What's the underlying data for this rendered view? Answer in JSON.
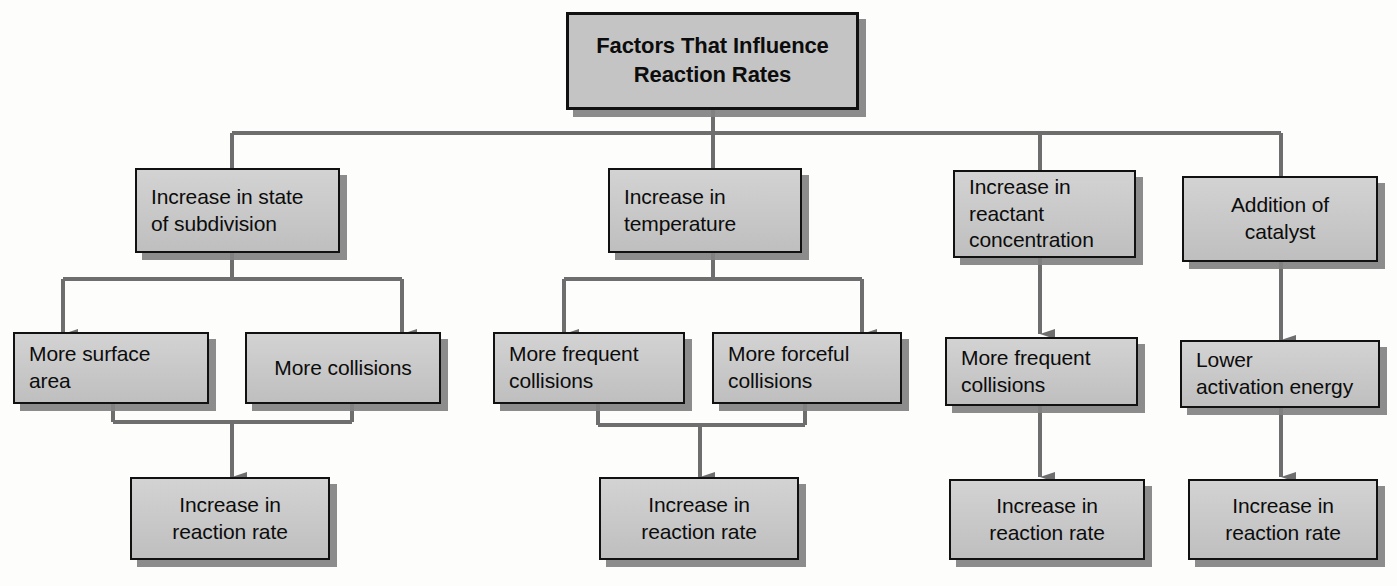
{
  "diagram": {
    "title_box": {
      "label": "Factors That Influence\nReaction Rates"
    },
    "factors": [
      {
        "id": "subdivision",
        "label": "Increase in state\nof subdivision"
      },
      {
        "id": "temperature",
        "label": "Increase in\ntemperature"
      },
      {
        "id": "concentration",
        "label": "Increase in\nreactant\nconcentration"
      },
      {
        "id": "catalyst",
        "label": "Addition of\ncatalyst"
      }
    ],
    "effects": [
      {
        "id": "more-surface-area",
        "label": "More surface\narea"
      },
      {
        "id": "more-collisions",
        "label": "More collisions"
      },
      {
        "id": "more-frequent-collisions-temp",
        "label": "More frequent\ncollisions"
      },
      {
        "id": "more-forceful-collisions",
        "label": "More forceful\ncollisions"
      },
      {
        "id": "more-frequent-collisions-conc",
        "label": "More frequent\ncollisions"
      },
      {
        "id": "lower-activation-energy",
        "label": "Lower\nactivation energy"
      }
    ],
    "outcomes": [
      {
        "id": "outcome-1",
        "label": "Increase in\nreaction rate"
      },
      {
        "id": "outcome-2",
        "label": "Increase in\nreaction rate"
      },
      {
        "id": "outcome-3",
        "label": "Increase in\nreaction rate"
      },
      {
        "id": "outcome-4",
        "label": "Increase in\nreaction rate"
      }
    ],
    "colors": {
      "box_fill": "#c9c9c9",
      "box_border": "#111111",
      "box_shadow": "#828282",
      "connector": "#6b6b6b",
      "background": "#fdfdfc",
      "text": "#0c0c0c"
    }
  }
}
